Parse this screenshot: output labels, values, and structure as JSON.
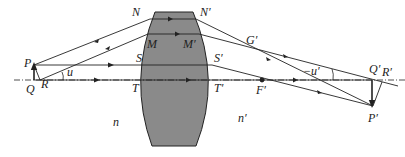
{
  "diagram": {
    "type": "thick-lens ray diagram",
    "colors": {
      "lens_fill": "#8a8a8a",
      "line": "#222222",
      "background": "#ffffff"
    },
    "labels": {
      "N": "N",
      "N_prime": "N′",
      "M": "M",
      "M_prime": "M′",
      "S": "S",
      "S_prime": "S′",
      "T": "T",
      "T_prime": "T′",
      "P": "P",
      "Q": "Q",
      "R": "R",
      "u": "u",
      "G_prime": "G′",
      "F_prime": "F′",
      "neg_u_prime": "−u′",
      "Q_prime": "Q′",
      "R_prime": "R′",
      "P_prime": "P′",
      "n": "n",
      "n_prime": "n′"
    }
  }
}
